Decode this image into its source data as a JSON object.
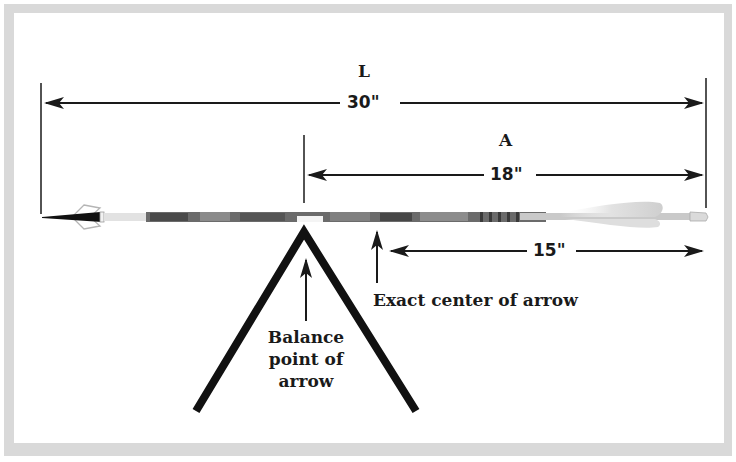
{
  "diagram": {
    "labels": {
      "overall_length_letter": "L",
      "overall_length_value": "30\"",
      "balance_distance_letter": "A",
      "balance_distance_value": "18\"",
      "half_length_value": "15\"",
      "center_caption": "Exact center of arrow",
      "balance_caption_line1": "Balance",
      "balance_caption_line2": "point of",
      "balance_caption_line3": "arrow"
    },
    "colors": {
      "frame": "#d9d9d9",
      "background": "#ffffff",
      "ink": "#1a1a1a",
      "shaft_camo_dark": "#4a4a4a",
      "shaft_camo_light": "#8a8a8a",
      "fletching": "#e6e6e6"
    }
  }
}
